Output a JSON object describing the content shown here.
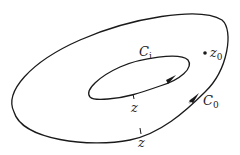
{
  "diagram": {
    "type": "contour-annulus",
    "stroke_color": "#1a1a1a",
    "labels": {
      "inner_contour": {
        "base": "C",
        "sub": "i"
      },
      "outer_contour": {
        "base": "C",
        "sub": "0"
      },
      "point": {
        "base": "z",
        "sub": "0"
      },
      "inner_z": "z",
      "outer_z": "z"
    }
  }
}
